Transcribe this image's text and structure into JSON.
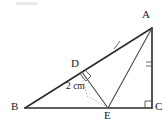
{
  "figure": {
    "type": "geometry-diagram",
    "shape": "right-triangle-with-cevian-and-altitude",
    "background_color": "#ffffff",
    "stroke_color": "#2b2b2b",
    "helper_color": "#8c8c8c",
    "labels": {
      "A": "A",
      "B": "B",
      "C": "C",
      "D": "D",
      "E": "E"
    },
    "measurement": {
      "value": "2 cm",
      "from": "D",
      "to": "E"
    },
    "marks": {
      "right_angle_at_C": "right-angle",
      "right_angle_at_D": "right-angle",
      "single_tick_on_BA": "single-tick",
      "double_tick_on_AC": "double-tick"
    },
    "vertices": {
      "A": {
        "x": 152,
        "y": 28
      },
      "B": {
        "x": 25,
        "y": 108
      },
      "C": {
        "x": 152,
        "y": 108
      },
      "D": {
        "x": 82,
        "y": 72
      },
      "E": {
        "x": 108,
        "y": 108
      }
    },
    "segments": [
      {
        "name": "BA",
        "from": "B",
        "to": "A",
        "style": "solid"
      },
      {
        "name": "BC",
        "from": "B",
        "to": "C",
        "style": "solid"
      },
      {
        "name": "AC",
        "from": "A",
        "to": "C",
        "style": "solid"
      },
      {
        "name": "DE",
        "from": "D",
        "to": "E",
        "style": "solid"
      },
      {
        "name": "AE",
        "from": "A",
        "to": "E",
        "style": "solid"
      },
      {
        "name": "DE-measure",
        "from": "D",
        "to": "E",
        "style": "dotted"
      }
    ]
  }
}
